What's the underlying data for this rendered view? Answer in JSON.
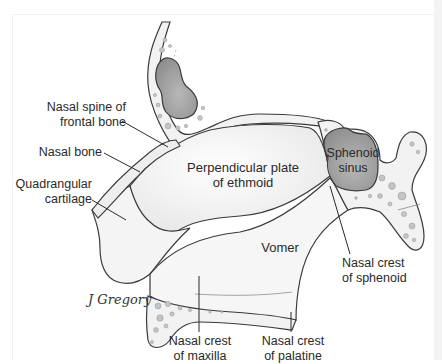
{
  "figure": {
    "type": "anatomical-illustration",
    "colors": {
      "background": "#ffffff",
      "bone_fill": "#f7f7f7",
      "cortical_fill": "#efefef",
      "sinus_fill": "#9a9a9a",
      "outline": "#3a3a3a",
      "text": "#2a2a2a"
    }
  },
  "labels": {
    "nasal_spine_frontal": [
      "Nasal spine of",
      "frontal bone"
    ],
    "nasal_bone": "Nasal bone",
    "quadrangular_cartilage": [
      "Quadrangular",
      "cartilage"
    ],
    "perpendicular_plate": [
      "Perpendicular plate",
      "of ethmoid"
    ],
    "sphenoid_sinus": [
      "Sphenoid",
      "sinus"
    ],
    "vomer": "Vomer",
    "nasal_crest_sphenoid": [
      "Nasal crest",
      "of sphenoid"
    ],
    "nasal_crest_maxilla": [
      "Nasal crest",
      "of maxilla"
    ],
    "nasal_crest_palatine": [
      "Nasal crest",
      "of palatine"
    ]
  },
  "signature": "J Gregory"
}
